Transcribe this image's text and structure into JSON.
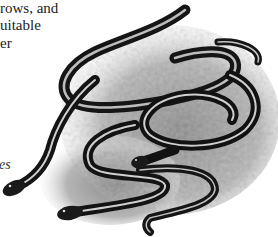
{
  "page": {
    "body_text_lines": [
      "rows, and",
      "uitable",
      "er"
    ],
    "caption_fragment": "es"
  },
  "illustration": {
    "subject": "garter snakes on rocky ground",
    "icon": "snake-illustration",
    "colors": {
      "ink": "#1a1a1a",
      "stripe": "#d9d9d9",
      "ground": "#9a9a9a",
      "paper": "#ffffff"
    }
  }
}
